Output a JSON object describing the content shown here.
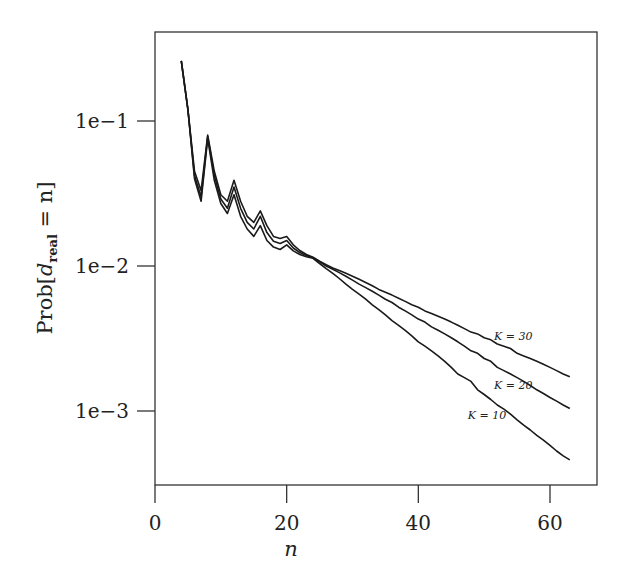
{
  "chart_data": {
    "type": "line",
    "title": "",
    "xlabel": "n",
    "ylabel": "Prob[d_real = n]",
    "ylabel_parts": {
      "prefix": "Prob[",
      "var": "d",
      "sub": "real",
      "suffix": " = n]"
    },
    "xscale": "linear",
    "yscale": "log",
    "xlim": [
      0,
      67
    ],
    "ylim": [
      0.00029,
      0.41
    ],
    "grid": false,
    "legend": "inline labels near line ends",
    "x_ticks": [
      0,
      20,
      40,
      60
    ],
    "x_tick_labels": [
      "0",
      "20",
      "40",
      "60"
    ],
    "y_ticks": [
      0.1,
      0.01,
      0.001
    ],
    "y_tick_labels": [
      "1e−1",
      "1e−2",
      "1e−3"
    ],
    "x": [
      4,
      5,
      6,
      7,
      8,
      9,
      10,
      11,
      12,
      13,
      14,
      15,
      16,
      17,
      18,
      19,
      20,
      21,
      22,
      23,
      24,
      25,
      26,
      27,
      28,
      29,
      30,
      31,
      32,
      33,
      34,
      35,
      36,
      37,
      38,
      39,
      40,
      41,
      42,
      43,
      44,
      45,
      46,
      47,
      48,
      49,
      50,
      51,
      52,
      53,
      54,
      55,
      56,
      57,
      58,
      59,
      60,
      61,
      62,
      63
    ],
    "series": [
      {
        "name": "K = 30",
        "label": "K = 30",
        "label_pos": [
          51.5,
          0.0031
        ],
        "values": [
          0.26,
          0.12,
          0.045,
          0.033,
          0.08,
          0.045,
          0.031,
          0.028,
          0.039,
          0.028,
          0.022,
          0.02,
          0.024,
          0.019,
          0.016,
          0.0155,
          0.016,
          0.014,
          0.0128,
          0.012,
          0.0115,
          0.0108,
          0.0102,
          0.0097,
          0.0093,
          0.0089,
          0.0085,
          0.0081,
          0.0077,
          0.0073,
          0.0069,
          0.0066,
          0.0063,
          0.006,
          0.0057,
          0.0054,
          0.0052,
          0.0049,
          0.0047,
          0.0045,
          0.0043,
          0.0041,
          0.0039,
          0.0037,
          0.0035,
          0.0034,
          0.0032,
          0.0031,
          0.0029,
          0.0028,
          0.0027,
          0.0025,
          0.0024,
          0.0023,
          0.0022,
          0.0021,
          0.002,
          0.0019,
          0.0018,
          0.00172
        ]
      },
      {
        "name": "K = 20",
        "label": "K = 20",
        "label_pos": [
          51.5,
          0.00142
        ],
        "values": [
          0.26,
          0.12,
          0.042,
          0.03,
          0.078,
          0.042,
          0.029,
          0.025,
          0.035,
          0.025,
          0.02,
          0.018,
          0.022,
          0.017,
          0.0148,
          0.0143,
          0.015,
          0.0133,
          0.0124,
          0.0118,
          0.0114,
          0.0107,
          0.01,
          0.0095,
          0.009,
          0.0085,
          0.008,
          0.0075,
          0.0071,
          0.0067,
          0.0063,
          0.0059,
          0.0056,
          0.0052,
          0.0049,
          0.0046,
          0.0043,
          0.0041,
          0.0038,
          0.0036,
          0.0034,
          0.0032,
          0.003,
          0.0028,
          0.0026,
          0.0025,
          0.0023,
          0.0022,
          0.002,
          0.0019,
          0.0018,
          0.0017,
          0.0016,
          0.0015,
          0.0014,
          0.00132,
          0.00124,
          0.00117,
          0.0011,
          0.00104
        ]
      },
      {
        "name": "K = 10",
        "label": "K = 10",
        "label_pos": [
          47.5,
          0.00088
        ],
        "values": [
          0.26,
          0.12,
          0.04,
          0.028,
          0.076,
          0.039,
          0.027,
          0.023,
          0.031,
          0.022,
          0.018,
          0.016,
          0.019,
          0.015,
          0.0135,
          0.013,
          0.014,
          0.0127,
          0.012,
          0.0116,
          0.0113,
          0.0104,
          0.0096,
          0.0089,
          0.0082,
          0.0075,
          0.0069,
          0.0064,
          0.0059,
          0.0054,
          0.005,
          0.0046,
          0.0042,
          0.0039,
          0.0036,
          0.0033,
          0.003,
          0.0028,
          0.0026,
          0.0024,
          0.0022,
          0.002,
          0.0018,
          0.0017,
          0.0016,
          0.0014,
          0.0013,
          0.0012,
          0.0011,
          0.00103,
          0.00095,
          0.00087,
          0.0008,
          0.00074,
          0.00068,
          0.00063,
          0.00058,
          0.00053,
          0.00049,
          0.00046
        ]
      }
    ],
    "colors": {
      "line": "#1a1a1a",
      "axis": "#333333",
      "background": "#ffffff"
    }
  }
}
